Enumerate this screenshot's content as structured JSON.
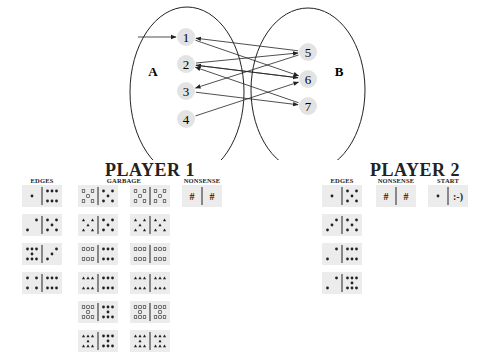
{
  "graph": {
    "set_a_label": "A",
    "set_b_label": "B",
    "nodes": [
      {
        "id": "1",
        "x": 186,
        "y": 37
      },
      {
        "id": "2",
        "x": 186,
        "y": 64
      },
      {
        "id": "3",
        "x": 186,
        "y": 91
      },
      {
        "id": "4",
        "x": 186,
        "y": 119
      },
      {
        "id": "5",
        "x": 308,
        "y": 52
      },
      {
        "id": "6",
        "x": 308,
        "y": 79
      },
      {
        "id": "7",
        "x": 308,
        "y": 106
      }
    ],
    "start_arrow_target": "1",
    "edges": [
      {
        "from": "5",
        "to": "1"
      },
      {
        "from": "1",
        "to": "6"
      },
      {
        "from": "2",
        "to": "5"
      },
      {
        "from": "6",
        "to": "2"
      },
      {
        "from": "2",
        "to": "6"
      },
      {
        "from": "7",
        "to": "2"
      },
      {
        "from": "5",
        "to": "3"
      },
      {
        "from": "3",
        "to": "7"
      },
      {
        "from": "4",
        "to": "6"
      }
    ]
  },
  "player1": {
    "title": "PLAYER 1",
    "edges_label": "EDGES",
    "garbage_label": "GARBAGE",
    "nonsense_label": "NONSENSE",
    "edges": [
      {
        "left": "pos1",
        "right": "dots6"
      },
      {
        "left": "pos2",
        "right": "pos5"
      },
      {
        "left": "dots7",
        "right": "pos3"
      },
      {
        "left": "pos4",
        "right": "dots6"
      }
    ],
    "garbage": [
      [
        {
          "left": "sq5",
          "right": "dot5"
        },
        {
          "left": "sq5",
          "right": "sq5"
        }
      ],
      [
        {
          "left": "tri5",
          "right": "dot5"
        },
        {
          "left": "tri5",
          "right": "tri5"
        }
      ],
      [
        {
          "left": "sq6",
          "right": "dot6"
        },
        {
          "left": "sq6",
          "right": "sq6"
        }
      ],
      [
        {
          "left": "tri6",
          "right": "dot6"
        },
        {
          "left": "tri6",
          "right": "tri6"
        }
      ],
      [
        {
          "left": "sq7",
          "right": "dot7"
        },
        {
          "left": "sq7",
          "right": "sq7"
        }
      ],
      [
        {
          "left": "tri7",
          "right": "dot7"
        },
        {
          "left": "tri7",
          "right": "tri7"
        }
      ]
    ],
    "nonsense": {
      "left": "#",
      "right": "#"
    }
  },
  "player2": {
    "title": "PLAYER 2",
    "edges_label": "EDGES",
    "nonsense_label": "NONSENSE",
    "start_label": "START",
    "edges": [
      {
        "left": "pos1",
        "right": "dot5"
      },
      {
        "left": "pos3",
        "right": "dot5"
      },
      {
        "left": "pos2",
        "right": "dots6"
      },
      {
        "left": "pos2",
        "right": "dots7"
      }
    ],
    "nonsense": {
      "left": "#",
      "right": "#"
    },
    "start": {
      "left": "pos1",
      "right": ":-)"
    }
  }
}
